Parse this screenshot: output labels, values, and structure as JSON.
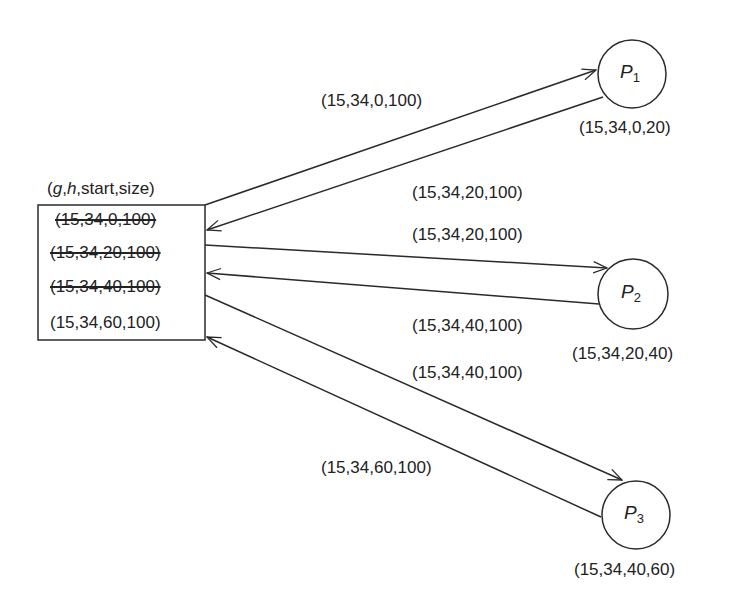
{
  "table": {
    "header": {
      "g": "g",
      "sep1": ",",
      "h": "h",
      "rest": ",start,size)",
      "open": "("
    },
    "rows": [
      {
        "text": "(15,34,0,100)",
        "struck": true
      },
      {
        "text": "(15,34,20,100)",
        "struck": true
      },
      {
        "text": "(15,34,40,100)",
        "struck": true
      },
      {
        "text": "(15,34,60,100)",
        "struck": false
      }
    ]
  },
  "processes": [
    {
      "name": "P",
      "sub": "1",
      "state": "(15,34,0,20)"
    },
    {
      "name": "P",
      "sub": "2",
      "state": "(15,34,20,40)"
    },
    {
      "name": "P",
      "sub": "3",
      "state": "(15,34,40,60)"
    }
  ],
  "messages": [
    {
      "label": "(15,34,0,100)",
      "direction": "to P1"
    },
    {
      "label": "(15,34,20,100)",
      "direction": "from P1"
    },
    {
      "label": "(15,34,20,100)",
      "direction": "to P2"
    },
    {
      "label": "(15,34,40,100)",
      "direction": "from P2"
    },
    {
      "label": "(15,34,40,100)",
      "direction": "to P3"
    },
    {
      "label": "(15,34,60,100)",
      "direction": "from P3"
    }
  ],
  "colors": {
    "stroke": "#2a2a2a",
    "text": "#222222"
  }
}
